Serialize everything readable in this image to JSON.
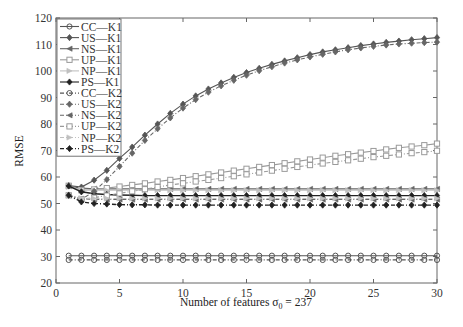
{
  "chart_data": {
    "type": "line",
    "title": "",
    "xlabel": "Number of features σ0 = 237",
    "ylabel": "RMSE",
    "xlim": [
      0,
      30
    ],
    "ylim": [
      20,
      120
    ],
    "xticks": [
      0,
      5,
      10,
      15,
      20,
      25,
      30
    ],
    "yticks": [
      20,
      30,
      40,
      50,
      60,
      70,
      80,
      90,
      100,
      110,
      120
    ],
    "grid": false,
    "legend_position": "upper-left",
    "x": [
      1,
      2,
      3,
      4,
      5,
      6,
      7,
      8,
      9,
      10,
      11,
      12,
      13,
      14,
      15,
      16,
      17,
      18,
      19,
      20,
      21,
      22,
      23,
      24,
      25,
      26,
      27,
      28,
      29,
      30
    ],
    "series": [
      {
        "name": "CC—K1",
        "style": "solid",
        "marker": "circle",
        "color": "#555555",
        "values": [
          30.3,
          30.3,
          30.3,
          30.3,
          30.3,
          30.3,
          30.3,
          30.3,
          30.3,
          30.3,
          30.3,
          30.3,
          30.3,
          30.3,
          30.3,
          30.3,
          30.3,
          30.3,
          30.3,
          30.3,
          30.3,
          30.3,
          30.3,
          30.3,
          30.3,
          30.3,
          30.3,
          30.3,
          30.3,
          30.3
        ]
      },
      {
        "name": "US—K1",
        "style": "solid",
        "marker": "diamond",
        "color": "#555555",
        "values": [
          56.8,
          56.2,
          58.8,
          62.5,
          67.0,
          71.3,
          75.8,
          80.0,
          84.0,
          87.5,
          90.6,
          93.2,
          95.5,
          97.6,
          99.4,
          101.0,
          102.5,
          103.8,
          105.0,
          106.2,
          107.2,
          108.0,
          108.8,
          109.6,
          110.2,
          110.8,
          111.3,
          111.8,
          112.2,
          112.6
        ]
      },
      {
        "name": "NS—K1",
        "style": "solid",
        "marker": "left-triangle",
        "color": "#666666",
        "values": [
          56.5,
          55.8,
          55.6,
          55.5,
          55.5,
          55.5,
          55.5,
          55.5,
          55.5,
          55.5,
          55.5,
          55.5,
          55.5,
          55.5,
          55.5,
          55.5,
          55.5,
          55.5,
          55.5,
          55.5,
          55.5,
          55.5,
          55.5,
          55.5,
          55.5,
          55.5,
          55.5,
          55.5,
          55.5,
          55.5
        ]
      },
      {
        "name": "UP—K1",
        "style": "solid",
        "marker": "square",
        "color": "#9a9a9a",
        "values": [
          56.7,
          55.0,
          55.3,
          55.8,
          56.4,
          57.0,
          57.6,
          58.3,
          58.9,
          59.6,
          60.3,
          61.0,
          61.7,
          62.4,
          63.1,
          63.8,
          64.5,
          65.2,
          65.9,
          66.6,
          67.3,
          68.0,
          68.6,
          69.2,
          69.8,
          70.4,
          71.0,
          71.5,
          72.0,
          72.6
        ]
      },
      {
        "name": "NP—K1",
        "style": "solid",
        "marker": "right-triangle",
        "color": "#c0c0c0",
        "values": [
          56.3,
          55.2,
          55.0,
          55.0,
          55.0,
          55.0,
          55.0,
          55.0,
          55.0,
          55.0,
          55.0,
          55.0,
          55.0,
          55.0,
          55.0,
          55.0,
          55.0,
          55.0,
          55.0,
          55.0,
          55.0,
          55.0,
          55.0,
          55.0,
          55.0,
          55.0,
          55.0,
          55.0,
          55.0,
          55.0
        ]
      },
      {
        "name": "PS—K1",
        "style": "solid",
        "marker": "diamond",
        "color": "#222222",
        "values": [
          56.6,
          54.4,
          53.7,
          53.4,
          53.2,
          53.1,
          53.0,
          53.0,
          53.0,
          53.0,
          53.0,
          53.0,
          53.0,
          53.0,
          53.0,
          53.0,
          53.0,
          53.0,
          53.0,
          53.0,
          53.0,
          53.0,
          53.0,
          53.0,
          53.0,
          53.0,
          53.0,
          53.0,
          53.0,
          53.0
        ]
      },
      {
        "name": "CC—K2",
        "style": "dashed",
        "marker": "circle",
        "color": "#555555",
        "values": [
          28.7,
          28.7,
          28.7,
          28.7,
          28.7,
          28.7,
          28.7,
          28.7,
          28.7,
          28.7,
          28.7,
          28.7,
          28.7,
          28.7,
          28.7,
          28.7,
          28.7,
          28.7,
          28.7,
          28.7,
          28.7,
          28.7,
          28.7,
          28.7,
          28.7,
          28.7,
          28.7,
          28.7,
          28.7,
          28.7
        ]
      },
      {
        "name": "US—K2",
        "style": "dashed",
        "marker": "diamond",
        "color": "#666666",
        "values": [
          53.2,
          51.5,
          54.6,
          59.0,
          64.0,
          69.0,
          73.8,
          78.2,
          82.3,
          86.0,
          89.2,
          92.0,
          94.4,
          96.5,
          98.4,
          100.1,
          101.6,
          103.0,
          104.2,
          105.3,
          106.3,
          107.2,
          108.0,
          108.7,
          109.3,
          109.8,
          110.2,
          110.5,
          110.7,
          110.9
        ]
      },
      {
        "name": "NS—K2",
        "style": "dashed",
        "marker": "left-triangle",
        "color": "#666666",
        "values": [
          53.0,
          51.8,
          51.6,
          51.5,
          51.5,
          51.5,
          51.5,
          51.5,
          51.5,
          51.5,
          51.5,
          51.5,
          51.5,
          51.5,
          51.5,
          51.5,
          51.5,
          51.5,
          51.5,
          51.5,
          51.5,
          51.5,
          51.5,
          51.5,
          51.5,
          51.5,
          51.5,
          51.5,
          51.5,
          51.5
        ]
      },
      {
        "name": "UP—K2",
        "style": "dashed",
        "marker": "square",
        "color": "#9a9a9a",
        "values": [
          53.1,
          51.6,
          52.2,
          53.0,
          53.8,
          54.6,
          55.4,
          56.2,
          57.0,
          57.6,
          58.3,
          58.9,
          59.6,
          60.3,
          61.0,
          61.7,
          62.4,
          63.1,
          63.8,
          64.5,
          65.1,
          65.7,
          66.3,
          66.9,
          67.5,
          68.0,
          68.5,
          69.0,
          69.4,
          69.9
        ]
      },
      {
        "name": "NP—K2",
        "style": "dashed",
        "marker": "right-triangle",
        "color": "#c0c0c0",
        "values": [
          53.0,
          52.0,
          51.9,
          51.9,
          51.9,
          51.9,
          51.9,
          51.9,
          51.9,
          51.9,
          51.9,
          51.9,
          51.9,
          51.9,
          51.9,
          51.9,
          51.9,
          51.9,
          51.9,
          51.9,
          51.9,
          51.9,
          51.9,
          51.9,
          51.9,
          51.9,
          51.9,
          51.9,
          51.9,
          51.9
        ]
      },
      {
        "name": "PS—K2",
        "style": "dashed",
        "marker": "diamond",
        "color": "#222222",
        "values": [
          53.1,
          50.6,
          50.0,
          49.8,
          49.6,
          49.5,
          49.5,
          49.4,
          49.4,
          49.4,
          49.4,
          49.4,
          49.4,
          49.4,
          49.4,
          49.4,
          49.4,
          49.4,
          49.4,
          49.4,
          49.4,
          49.4,
          49.4,
          49.4,
          49.4,
          49.4,
          49.4,
          49.4,
          49.4,
          49.4
        ]
      }
    ]
  }
}
